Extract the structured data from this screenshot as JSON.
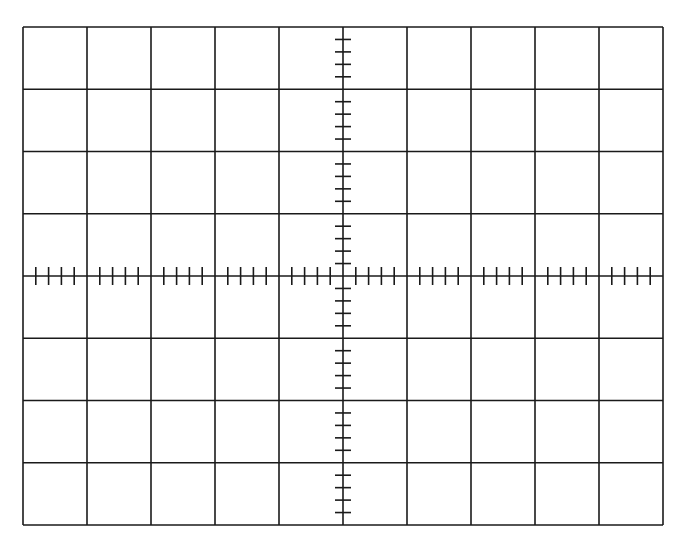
{
  "graticule": {
    "title": "Oscilloscope graticule",
    "left": 23,
    "top": 27,
    "right": 663,
    "bottom": 525,
    "columns": 10,
    "rows": 8,
    "minor_ticks_per_division": 5,
    "line_color": "#1a1a1a",
    "background": "#ffffff",
    "major_line_width": 1.6,
    "tick_half_length_h": 9,
    "tick_half_length_v": 8
  }
}
